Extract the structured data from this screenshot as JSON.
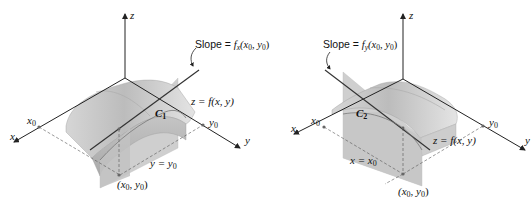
{
  "figure_left": {
    "axis_labels": {
      "z": "z",
      "x": "x",
      "y": "y"
    },
    "x0_label": "x",
    "x0_sub": "0",
    "y0_label": "y",
    "y0_sub": "0",
    "slope_prefix": "Slope = ",
    "slope_func": "f",
    "slope_sub": "x",
    "slope_args": "(x",
    "slope_args_sub1": "0",
    "slope_args_mid": ", y",
    "slope_args_sub2": "0",
    "slope_args_end": ")",
    "surface_label": "z = f(x, y)",
    "curve_label": "C",
    "curve_sub": "1",
    "plane_label": "y = y",
    "plane_sub": "0",
    "point_label": "(x",
    "point_sub1": "0",
    "point_mid": ", y",
    "point_sub2": "0",
    "point_end": ")"
  },
  "figure_right": {
    "axis_labels": {
      "z": "z",
      "x": "x",
      "y": "y"
    },
    "x0_label": "x",
    "x0_sub": "0",
    "y0_label": "y",
    "y0_sub": "0",
    "slope_prefix": "Slope = ",
    "slope_func": "f",
    "slope_sub": "y",
    "slope_args": "(x",
    "slope_args_sub1": "0",
    "slope_args_mid": ", y",
    "slope_args_sub2": "0",
    "slope_args_end": ")",
    "surface_label": "z = f(x, y)",
    "curve_label": "C",
    "curve_sub": "2",
    "plane_label": "x = x",
    "plane_sub": "0",
    "point_label": "(x",
    "point_sub1": "0",
    "point_mid": ", y",
    "point_sub2": "0",
    "point_end": ")"
  },
  "colors": {
    "surface_light": "#d8d8d8",
    "surface_mid": "#bdbdbd",
    "surface_dark": "#a6a6a6",
    "plane": "#c9c9c9",
    "axis": "#222222"
  }
}
